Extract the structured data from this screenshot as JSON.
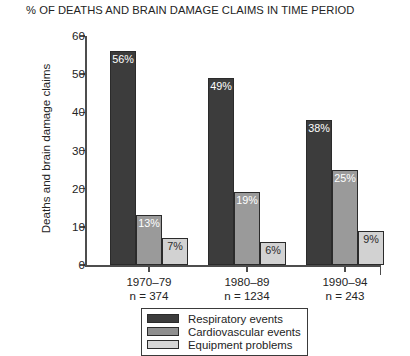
{
  "chart_data": {
    "type": "bar",
    "title": "% OF DEATHS AND BRAIN DAMAGE CLAIMS IN TIME PERIOD",
    "xlabel": "",
    "ylabel": "Deaths and brain damage claims",
    "ylim": [
      0,
      60
    ],
    "ytick_labels": [
      "60",
      "50",
      "40",
      "30",
      "20",
      "10",
      "0"
    ],
    "yticks": [
      60,
      50,
      40,
      30,
      20,
      10,
      0
    ],
    "grid": false,
    "legend_position": "bottom",
    "categories": [
      "1970–79",
      "1980–89",
      "1990–94"
    ],
    "category_counts": [
      "n = 374",
      "n = 1234",
      "n = 243"
    ],
    "series": [
      {
        "name": "Respiratory events",
        "color": "#3c3c3c",
        "values": [
          56,
          49,
          38
        ],
        "labels": [
          "56%",
          "49%",
          "38%"
        ]
      },
      {
        "name": "Cardiovascular events",
        "color": "#9a9a9a",
        "values": [
          13,
          19,
          25
        ],
        "labels": [
          "13%",
          "19%",
          "25%"
        ]
      },
      {
        "name": "Equipment problems",
        "color": "#d2d2d2",
        "values": [
          7,
          6,
          9
        ],
        "labels": [
          "7%",
          "6%",
          "9%"
        ]
      }
    ]
  },
  "groups": [
    {
      "category": "1970–79",
      "count": "n = 374",
      "bars": [
        {
          "series": "Respiratory events",
          "value": 56,
          "label": "56%"
        },
        {
          "series": "Cardiovascular events",
          "value": 13,
          "label": "13%"
        },
        {
          "series": "Equipment problems",
          "value": 7,
          "label": "7%"
        }
      ]
    },
    {
      "category": "1980–89",
      "count": "n = 1234",
      "bars": [
        {
          "series": "Respiratory events",
          "value": 49,
          "label": "49%"
        },
        {
          "series": "Cardiovascular events",
          "value": 19,
          "label": "19%"
        },
        {
          "series": "Equipment problems",
          "value": 6,
          "label": "6%"
        }
      ]
    },
    {
      "category": "1990–94",
      "count": "n = 243",
      "bars": [
        {
          "series": "Respiratory events",
          "value": 38,
          "label": "38%"
        },
        {
          "series": "Cardiovascular events",
          "value": 25,
          "label": "25%"
        },
        {
          "series": "Equipment problems",
          "value": 9,
          "label": "9%"
        }
      ]
    }
  ],
  "legend": {
    "items": [
      {
        "label": "Respiratory events",
        "color": "#3c3c3c"
      },
      {
        "label": "Cardiovascular events",
        "color": "#8f8f8f"
      },
      {
        "label": "Equipment problems",
        "color": "#d6d6d6"
      }
    ]
  }
}
